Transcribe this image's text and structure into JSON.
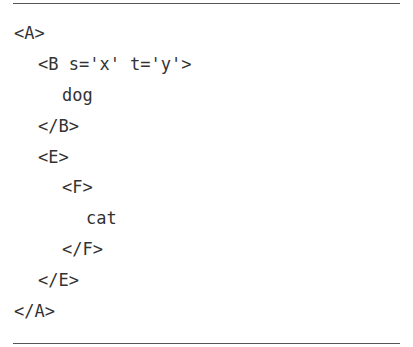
{
  "code_block": {
    "lines": [
      {
        "text": "<A>",
        "indent": 0
      },
      {
        "text": "<B s='x' t='y'>",
        "indent": 1
      },
      {
        "text": "dog",
        "indent": 2
      },
      {
        "text": "</B>",
        "indent": 1
      },
      {
        "text": "<E>",
        "indent": 1
      },
      {
        "text": "<F>",
        "indent": 2
      },
      {
        "text": "cat",
        "indent": 3
      },
      {
        "text": "</F>",
        "indent": 2
      },
      {
        "text": "</E>",
        "indent": 1
      },
      {
        "text": "</A>",
        "indent": 0
      }
    ]
  },
  "colors": {
    "text": "#333333",
    "rule": "#555555",
    "background": "#ffffff"
  }
}
